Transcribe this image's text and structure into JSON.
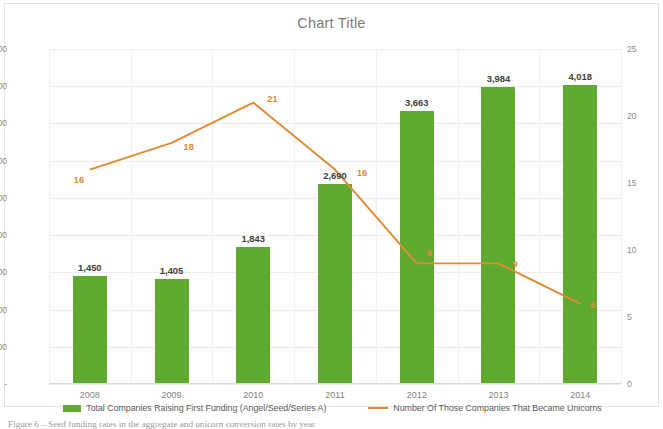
{
  "chart_data": {
    "type": "bar",
    "title": "Chart Title",
    "xlabel": "",
    "ylabel": "",
    "categories": [
      "2008",
      "2009",
      "2010",
      "2011",
      "2012",
      "2013",
      "2014"
    ],
    "grid": true,
    "legend_position": "bottom",
    "y_left": {
      "label": "",
      "ylim": [
        0,
        4500
      ],
      "ticks": [
        "-",
        "500",
        "1,000",
        "1,500",
        "2,000",
        "2,500",
        "3,000",
        "3,500",
        "4,000",
        "4,500"
      ],
      "tick_values": [
        0,
        500,
        1000,
        1500,
        2000,
        2500,
        3000,
        3500,
        4000,
        4500
      ]
    },
    "y_right": {
      "label": "",
      "ylim": [
        0,
        25
      ],
      "ticks": [
        "0",
        "5",
        "10",
        "15",
        "20",
        "25"
      ],
      "tick_values": [
        0,
        5,
        10,
        15,
        20,
        25
      ]
    },
    "series": [
      {
        "name": "Total Companies Raising First Funding (Angel/Seed/Series A)",
        "type": "bar",
        "axis": "left",
        "color": "#5faa2e",
        "values": [
          1450,
          1405,
          1843,
          2690,
          3663,
          3984,
          4018
        ],
        "labels": [
          "1,450",
          "1,405",
          "1,843",
          "2,690",
          "3,663",
          "3,984",
          "4,018"
        ]
      },
      {
        "name": "Number Of Those Companies That Became Unicorns",
        "type": "line",
        "axis": "right",
        "color": "#e08a33",
        "values": [
          16,
          18,
          21,
          16,
          9,
          9,
          6
        ],
        "labels": [
          "16",
          "18",
          "21",
          "16",
          "9",
          "9",
          "6"
        ]
      }
    ]
  },
  "caption": "Figure 6 – Seed funding rates in the aggregate and unicorn conversion rates by year"
}
